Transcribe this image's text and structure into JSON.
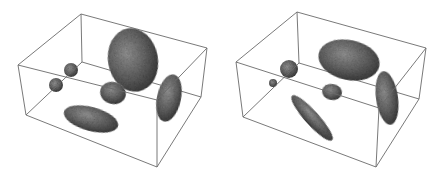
{
  "figure": {
    "colors": {
      "background": "#ffffff",
      "box_edge": "#6a6a6a",
      "ellipsoid_dark": "#3f3f3f",
      "ellipsoid_mid": "#6b6b6b",
      "ellipsoid_light": "#9a9a9a"
    },
    "panels": [
      {
        "id": "left",
        "box": {
          "top_back_left": [
            81,
            14
          ],
          "top_back_right": [
            207,
            48
          ],
          "top_front_left": [
            18,
            65
          ],
          "top_front_right": [
            157,
            100
          ],
          "bottom_back_left": [
            82,
            62
          ],
          "bottom_back_right": [
            201,
            97
          ],
          "bottom_front_left": [
            26,
            115
          ],
          "bottom_front_right": [
            157,
            167
          ]
        },
        "ellipsoids": [
          {
            "name": "large-top",
            "cx": 133,
            "cy": 60,
            "rx": 25,
            "ry": 32,
            "rot": -10
          },
          {
            "name": "small-sphere-back",
            "cx": 71,
            "cy": 70,
            "rx": 7,
            "ry": 7,
            "rot": 0
          },
          {
            "name": "small-sphere-front",
            "cx": 56,
            "cy": 85,
            "rx": 7,
            "ry": 7,
            "rot": 0
          },
          {
            "name": "medium-center",
            "cx": 113,
            "cy": 93,
            "rx": 13,
            "ry": 11,
            "rot": 15
          },
          {
            "name": "right-edge",
            "cx": 169,
            "cy": 98,
            "rx": 12,
            "ry": 24,
            "rot": 12
          },
          {
            "name": "flat-bottom",
            "cx": 91,
            "cy": 119,
            "rx": 28,
            "ry": 12,
            "rot": 15
          }
        ]
      },
      {
        "id": "right",
        "box": {
          "top_back_left": [
            297,
            12
          ],
          "top_back_right": [
            426,
            48
          ],
          "top_front_left": [
            236,
            62
          ],
          "top_front_right": [
            379,
            108
          ],
          "bottom_back_left": [
            299,
            63
          ],
          "bottom_back_right": [
            419,
            99
          ],
          "bottom_front_left": [
            243,
            117
          ],
          "bottom_front_right": [
            376,
            167
          ]
        },
        "ellipsoids": [
          {
            "name": "large-top",
            "cx": 349,
            "cy": 60,
            "rx": 31,
            "ry": 20,
            "rot": 12
          },
          {
            "name": "medium-sphere",
            "cx": 289,
            "cy": 69,
            "rx": 9,
            "ry": 9,
            "rot": 0
          },
          {
            "name": "small-sphere",
            "cx": 273,
            "cy": 83,
            "rx": 4,
            "ry": 4,
            "rot": 0
          },
          {
            "name": "small-center",
            "cx": 332,
            "cy": 92,
            "rx": 10,
            "ry": 8,
            "rot": 10
          },
          {
            "name": "right-edge",
            "cx": 387,
            "cy": 98,
            "rx": 11,
            "ry": 27,
            "rot": -8
          },
          {
            "name": "diagonal-bottom",
            "cx": 312,
            "cy": 118,
            "rx": 30,
            "ry": 7,
            "rot": 48
          }
        ]
      }
    ]
  }
}
